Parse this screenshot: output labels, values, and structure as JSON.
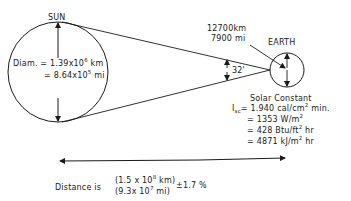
{
  "sun": {
    "label": "SUN",
    "diam_prefix": "Diam. =",
    "diam_km_base": "1.39x10",
    "diam_km_exp": "6",
    "diam_km_unit": " km",
    "diam_mi_prefix": "= ",
    "diam_mi_base": "8.64x10",
    "diam_mi_exp": "5",
    "diam_mi_unit": " mi"
  },
  "earth": {
    "label": "EARTH",
    "diam_km": "12700km",
    "diam_mi": "7900 mi"
  },
  "angle": {
    "label": "32'"
  },
  "solar_constant": {
    "title": "Solar Constant",
    "symbol": "I",
    "symbol_sub": "sc",
    "line1": "= 1.940 cal/cm",
    "line1_exp": "2",
    "line1_unit": " min.",
    "line2": "= 1353 W/m",
    "line2_exp": "2",
    "line3": "= 428 Btu/ft",
    "line3_exp": "2",
    "line3_unit": " hr",
    "line4": "= 4871 kJ/m",
    "line4_exp": "2",
    "line4_unit": " hr"
  },
  "distance": {
    "prefix": "Distance is",
    "km": "(1.5 x 10",
    "km_exp": "8",
    "km_unit": " km)",
    "mi": "(9.3x 10",
    "mi_exp": "7",
    "mi_unit": " mi)",
    "tolerance": "±1.7 %"
  }
}
